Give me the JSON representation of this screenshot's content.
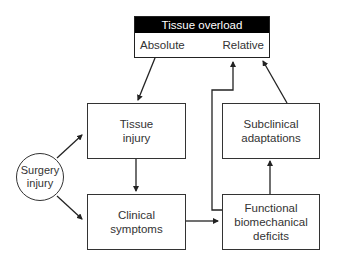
{
  "diagram": {
    "top_box": {
      "title": "Tissue overload",
      "left_label": "Absolute",
      "right_label": "Relative"
    },
    "nodes": [
      {
        "id": "tissue-injury",
        "line1": "Tissue",
        "line2": "injury"
      },
      {
        "id": "clinical-symptoms",
        "line1": "Clinical",
        "line2": "symptoms"
      },
      {
        "id": "subclinical-adaptations",
        "line1": "Subclinical",
        "line2": "adaptations"
      },
      {
        "id": "functional-deficits",
        "line1": "Functional",
        "line2": "biomechanical",
        "line3": "deficits"
      }
    ],
    "circle": {
      "line1": "Surgery",
      "line2": "injury"
    },
    "edges": [
      {
        "from": "Absolute",
        "to": "Tissue injury"
      },
      {
        "from": "Surgery injury",
        "to": "Tissue injury"
      },
      {
        "from": "Surgery injury",
        "to": "Clinical symptoms"
      },
      {
        "from": "Tissue injury",
        "to": "Clinical symptoms"
      },
      {
        "from": "Clinical symptoms",
        "to": "Functional biomechanical deficits"
      },
      {
        "from": "Functional biomechanical deficits",
        "to": "Subclinical adaptations"
      },
      {
        "from": "Functional biomechanical deficits",
        "to": "Tissue overload"
      },
      {
        "from": "Subclinical adaptations",
        "to": "Relative"
      }
    ]
  }
}
